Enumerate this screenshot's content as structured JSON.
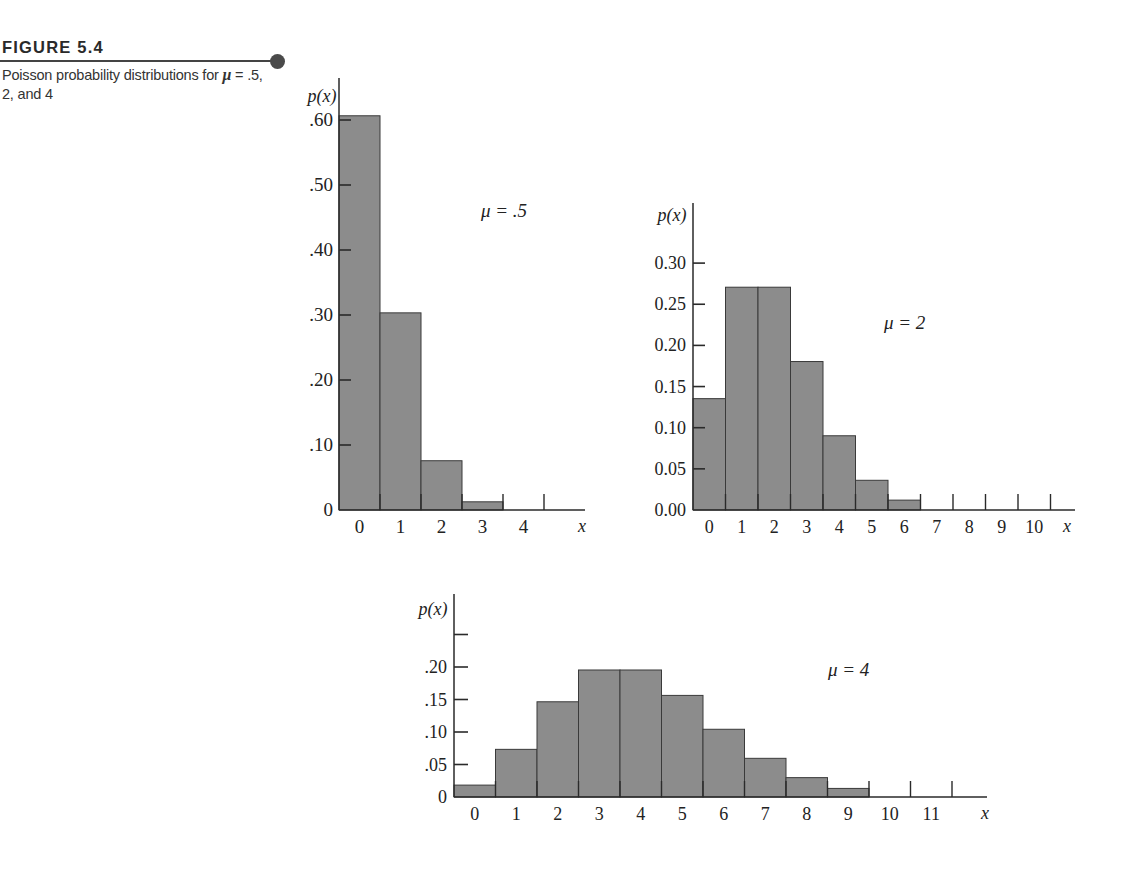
{
  "figure": {
    "title": "FIGURE 5.4",
    "caption_pre": "Poisson probability distributions for ",
    "caption_mu": "μ",
    "caption_post": " = .5, 2, and 4"
  },
  "colors": {
    "bar_fill": "#8c8c8c",
    "bar_stroke": "#3a3a3a",
    "axis": "#2a2a2a",
    "text": "#222222"
  },
  "chart_data": [
    {
      "type": "bar",
      "title": "μ = .5",
      "ylabel": "p(x)",
      "xlabel": "x",
      "categories": [
        "0",
        "1",
        "2",
        "3",
        "4"
      ],
      "values": [
        0.6065,
        0.3033,
        0.0758,
        0.0126,
        0.0016
      ],
      "y_ticks": [
        ".60",
        ".50",
        ".40",
        ".30",
        ".20",
        ".10",
        "0"
      ],
      "y_tick_values": [
        0.6,
        0.5,
        0.4,
        0.3,
        0.2,
        0.1,
        0
      ],
      "ylim": [
        0,
        0.6
      ],
      "grid": false,
      "legend": "none",
      "annotation": "μ = .5"
    },
    {
      "type": "bar",
      "title": "μ = 2",
      "ylabel": "p(x)",
      "xlabel": "x",
      "categories": [
        "0",
        "1",
        "2",
        "3",
        "4",
        "5",
        "6",
        "7",
        "8",
        "9",
        "10"
      ],
      "values": [
        0.1353,
        0.2707,
        0.2707,
        0.1804,
        0.0902,
        0.0361,
        0.012,
        0.0034,
        0.0009,
        0.0002,
        0.0
      ],
      "y_ticks": [
        "0.30",
        "0.25",
        "0.20",
        "0.15",
        "0.10",
        "0.05",
        "0.00"
      ],
      "y_tick_values": [
        0.3,
        0.25,
        0.2,
        0.15,
        0.1,
        0.05,
        0.0
      ],
      "ylim": [
        0,
        0.3
      ],
      "grid": false,
      "legend": "none",
      "annotation": "μ = 2"
    },
    {
      "type": "bar",
      "title": "μ = 4",
      "ylabel": "p(x)",
      "xlabel": "x",
      "categories": [
        "0",
        "1",
        "2",
        "3",
        "4",
        "5",
        "6",
        "7",
        "8",
        "9",
        "10",
        "11"
      ],
      "values": [
        0.0183,
        0.0733,
        0.1465,
        0.1954,
        0.1954,
        0.1563,
        0.1042,
        0.0595,
        0.0298,
        0.0132,
        0.0053,
        0.0019
      ],
      "y_ticks": [
        "",
        ".20",
        ".15",
        ".10",
        ".05",
        "0"
      ],
      "y_tick_values": [
        0.25,
        0.2,
        0.15,
        0.1,
        0.05,
        0
      ],
      "ylim": [
        0,
        0.25
      ],
      "grid": false,
      "legend": "none",
      "annotation": "μ = 4"
    }
  ]
}
